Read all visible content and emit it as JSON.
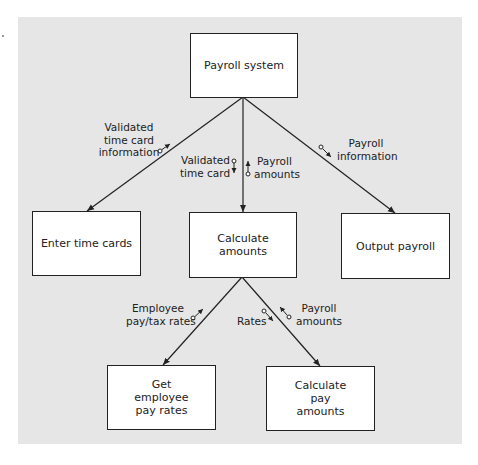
{
  "diagram": {
    "type": "structure-chart",
    "modules": {
      "root": "Payroll system",
      "enter_time_cards": "Enter time cards",
      "calculate_amounts": "Calculate amounts",
      "output_payroll": "Output payroll",
      "get_employee_pay_rates": "Get employee pay rates",
      "calculate_pay_amounts": "Calculate pay amounts"
    },
    "couples": {
      "validated_time_card_information": [
        "Validated",
        "time card",
        "information"
      ],
      "validated_time_card": [
        "Validated",
        "time card"
      ],
      "payroll_amounts_up": [
        "Payroll",
        "amounts"
      ],
      "payroll_information": [
        "Payroll",
        "information"
      ],
      "employee_pay_tax_rates": [
        "Employee",
        "pay/tax rates"
      ],
      "rates": [
        "Rates"
      ],
      "payroll_amounts_down": [
        "Payroll",
        "amounts"
      ]
    },
    "connections": [
      {
        "from": "Payroll system",
        "to": "Enter time cards",
        "data_up": "Validated time card information"
      },
      {
        "from": "Payroll system",
        "to": "Calculate amounts",
        "data_down": "Validated time card",
        "data_up": "Payroll amounts"
      },
      {
        "from": "Payroll system",
        "to": "Output payroll",
        "data_down": "Payroll information"
      },
      {
        "from": "Calculate amounts",
        "to": "Get employee pay rates",
        "data_up": "Employee pay/tax rates"
      },
      {
        "from": "Calculate amounts",
        "to": "Calculate pay amounts",
        "data_down": "Rates",
        "data_up": "Payroll amounts"
      }
    ],
    "colors": {
      "background_panel": "#e6e6e6",
      "box_fill": "#ffffff",
      "line": "#222222"
    }
  }
}
